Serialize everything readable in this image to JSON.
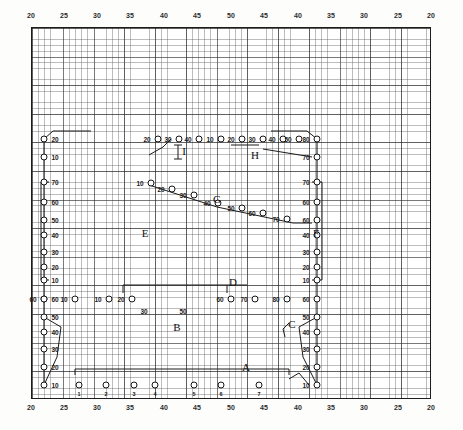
{
  "figure": {
    "kind": "graph-paper-survey-diagram",
    "ink_color": "#1a1a1a",
    "paper_color": "#ffffff",
    "grid_minor_color": "#5a5a5a",
    "grid_major_color": "#282828"
  },
  "axes": {
    "top": {
      "ticks": [
        {
          "label": "20",
          "x": 31
        },
        {
          "label": "25",
          "x": 64
        },
        {
          "label": "30",
          "x": 97
        },
        {
          "label": "35",
          "x": 130
        },
        {
          "label": "40",
          "x": 164
        },
        {
          "label": "45",
          "x": 197
        },
        {
          "label": "50",
          "x": 231
        },
        {
          "label": "45",
          "x": 264
        },
        {
          "label": "40",
          "x": 298
        },
        {
          "label": "35",
          "x": 331
        },
        {
          "label": "30",
          "x": 364
        },
        {
          "label": "25",
          "x": 398
        },
        {
          "label": "20",
          "x": 431
        }
      ]
    },
    "bottom": {
      "ticks": [
        {
          "label": "20",
          "x": 31
        },
        {
          "label": "25",
          "x": 64
        },
        {
          "label": "30",
          "x": 97
        },
        {
          "label": "35",
          "x": 130
        },
        {
          "label": "40",
          "x": 164
        },
        {
          "label": "45",
          "x": 197
        },
        {
          "label": "50",
          "x": 231
        },
        {
          "label": "45",
          "x": 264
        },
        {
          "label": "40",
          "x": 298
        },
        {
          "label": "35",
          "x": 331
        },
        {
          "label": "30",
          "x": 364
        },
        {
          "label": "25",
          "x": 398
        },
        {
          "label": "20",
          "x": 431
        }
      ]
    }
  },
  "section_labels": [
    {
      "name": "A",
      "x": 215,
      "y": 340
    },
    {
      "name": "B",
      "x": 146,
      "y": 300
    },
    {
      "name": "C",
      "x": 261,
      "y": 297
    },
    {
      "name": "D",
      "x": 202,
      "y": 255
    },
    {
      "name": "E",
      "x": 114,
      "y": 206
    },
    {
      "name": "F",
      "x": 285,
      "y": 206
    },
    {
      "name": "G",
      "x": 186,
      "y": 172
    },
    {
      "name": "H",
      "x": 224,
      "y": 128
    },
    {
      "name": "I",
      "x": 153,
      "y": 124
    }
  ],
  "left_column_values": [
    "20",
    "10",
    "70",
    "60",
    "50",
    "40",
    "30",
    "20",
    "10",
    "60",
    "50",
    "40",
    "30",
    "20",
    "10"
  ],
  "right_column_values": [
    "80",
    "70",
    "70",
    "60",
    "60",
    "40",
    "30",
    "20",
    "10",
    "60",
    "50",
    "40",
    "30",
    "20",
    "10"
  ],
  "rows": {
    "row_I": {
      "values": [
        "20",
        "30",
        "40",
        "10",
        "20",
        "30",
        "40",
        "50",
        "60"
      ],
      "lead_value": "10"
    },
    "row_H": {
      "values": [
        "70"
      ]
    },
    "row_G": {
      "values": [
        "10",
        "20",
        "30",
        "40",
        "50",
        "60",
        "70"
      ]
    },
    "row_D": {
      "values": [
        "60",
        "10",
        "10",
        "20",
        "60",
        "70",
        "70",
        "60"
      ],
      "below": [
        "30",
        "50"
      ]
    },
    "row_A": {
      "markers": [
        "1",
        "2",
        "3",
        "4",
        "5",
        "6",
        "7"
      ],
      "edge_values": [
        "10",
        "10"
      ]
    }
  },
  "left_edge_nodes": [
    {
      "value": "20",
      "x": 13,
      "y": 112
    },
    {
      "value": "10",
      "x": 13,
      "y": 130
    },
    {
      "value": "70",
      "x": 13,
      "y": 155
    },
    {
      "value": "60",
      "x": 13,
      "y": 175
    },
    {
      "value": "50",
      "x": 13,
      "y": 193
    },
    {
      "value": "40",
      "x": 13,
      "y": 208
    },
    {
      "value": "30",
      "x": 13,
      "y": 225
    },
    {
      "value": "20",
      "x": 13,
      "y": 240
    },
    {
      "value": "10",
      "x": 13,
      "y": 253
    },
    {
      "value": "60",
      "x": 13,
      "y": 272
    },
    {
      "value": "50",
      "x": 13,
      "y": 290
    },
    {
      "value": "40",
      "x": 13,
      "y": 305
    },
    {
      "value": "30",
      "x": 13,
      "y": 322
    },
    {
      "value": "20",
      "x": 13,
      "y": 340
    },
    {
      "value": "10",
      "x": 13,
      "y": 358
    }
  ],
  "right_edge_nodes": [
    {
      "value": "80",
      "x": 286,
      "y": 112
    },
    {
      "value": "70",
      "x": 286,
      "y": 130
    },
    {
      "value": "70",
      "x": 286,
      "y": 155
    },
    {
      "value": "60",
      "x": 286,
      "y": 175
    },
    {
      "value": "60",
      "x": 286,
      "y": 193
    },
    {
      "value": "40",
      "x": 286,
      "y": 208
    },
    {
      "value": "30",
      "x": 286,
      "y": 225
    },
    {
      "value": "20",
      "x": 286,
      "y": 240
    },
    {
      "value": "10",
      "x": 286,
      "y": 253
    },
    {
      "value": "60",
      "x": 286,
      "y": 272
    },
    {
      "value": "50",
      "x": 286,
      "y": 290
    },
    {
      "value": "40",
      "x": 286,
      "y": 305
    },
    {
      "value": "30",
      "x": 286,
      "y": 322
    },
    {
      "value": "20",
      "x": 286,
      "y": 340
    },
    {
      "value": "10",
      "x": 286,
      "y": 358
    }
  ],
  "row_I_nodes": [
    {
      "value": "20",
      "x": 127,
      "y": 112
    },
    {
      "value": "30",
      "x": 148,
      "y": 112
    },
    {
      "value": "40",
      "x": 168,
      "y": 112
    },
    {
      "value": "10",
      "x": 190,
      "y": 112
    },
    {
      "value": "20",
      "x": 211,
      "y": 112
    },
    {
      "value": "30",
      "x": 232,
      "y": 112
    },
    {
      "value": "40",
      "x": 252,
      "y": 112
    },
    {
      "value": "50",
      "x": 268,
      "y": 112
    }
  ],
  "row_G_nodes": [
    {
      "value": "10",
      "x": 120,
      "y": 156
    },
    {
      "value": "20",
      "x": 141,
      "y": 162
    },
    {
      "value": "30",
      "x": 163,
      "y": 168
    },
    {
      "value": "40",
      "x": 187,
      "y": 176
    },
    {
      "value": "50",
      "x": 211,
      "y": 181
    },
    {
      "value": "60",
      "x": 232,
      "y": 186
    },
    {
      "value": "70",
      "x": 256,
      "y": 192
    }
  ],
  "row_D_nodes": [
    {
      "value": "60",
      "x": 13,
      "y": 272
    },
    {
      "value": "10",
      "x": 44,
      "y": 272
    },
    {
      "value": "10",
      "x": 78,
      "y": 272
    },
    {
      "value": "20",
      "x": 101,
      "y": 272
    },
    {
      "value": "60",
      "x": 200,
      "y": 272
    },
    {
      "value": "70",
      "x": 224,
      "y": 272
    },
    {
      "value": "80",
      "x": 256,
      "y": 272
    }
  ],
  "row_D_below": [
    {
      "value": "30",
      "x": 113,
      "y": 284
    },
    {
      "value": "50",
      "x": 152,
      "y": 284
    }
  ],
  "row_A_nodes": [
    {
      "digit": "1",
      "x": 48,
      "y": 358
    },
    {
      "digit": "2",
      "x": 75,
      "y": 358
    },
    {
      "digit": "3",
      "x": 103,
      "y": 358
    },
    {
      "digit": "4",
      "x": 124,
      "y": 358
    },
    {
      "digit": "5",
      "x": 163,
      "y": 358
    },
    {
      "digit": "6",
      "x": 190,
      "y": 358
    },
    {
      "digit": "7",
      "x": 228,
      "y": 358
    }
  ]
}
